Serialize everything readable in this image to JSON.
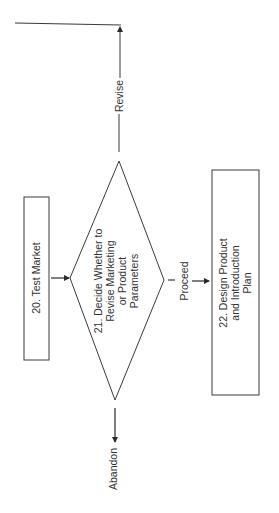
{
  "diagram": {
    "orientation": "rotated -90 degrees",
    "nodes": [
      {
        "id": "20",
        "type": "process",
        "label": "20.  Test Market",
        "lines": [
          "20.  Test Market"
        ]
      },
      {
        "id": "21",
        "type": "decision",
        "label": "21.  Decide Whether to Revise Marketing or Product Parameters",
        "lines": [
          "21.  Decide Whether to",
          "Revise Marketing",
          "or Product",
          "Parameters"
        ]
      },
      {
        "id": "22",
        "type": "process",
        "label": "22.  Design Product and Introduction Plan",
        "lines": [
          "22.  Design Product",
          "and Introduction",
          "Plan"
        ]
      }
    ],
    "edges": [
      {
        "from": "20",
        "to": "21",
        "label": ""
      },
      {
        "from": "21",
        "to": "22",
        "label": "Proceed"
      },
      {
        "from": "21",
        "to": "loop-back",
        "label": "Revise"
      },
      {
        "from": "21",
        "to": "exit",
        "label": "Abandon"
      }
    ],
    "colors": {
      "stroke": "#3a3a3a",
      "text": "#333333",
      "background": "#ffffff"
    }
  }
}
